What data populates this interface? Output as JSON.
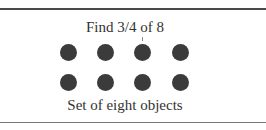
{
  "figure": {
    "title": "Find 3/4 of 8",
    "caption": "Set of eight objects",
    "dot_color": "#3b3b3b",
    "rows": 2,
    "columns": 4,
    "total_objects": 8,
    "marked_column": 3
  }
}
